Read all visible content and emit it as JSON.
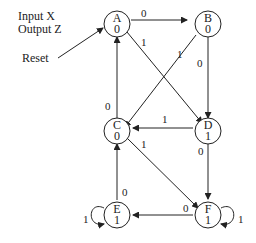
{
  "legend": {
    "input": "Input X",
    "output": "Output Z"
  },
  "reset_label": "Reset",
  "states": [
    {
      "name": "A",
      "output": "0"
    },
    {
      "name": "B",
      "output": "0"
    },
    {
      "name": "C",
      "output": "0"
    },
    {
      "name": "D",
      "output": "1"
    },
    {
      "name": "E",
      "output": "1"
    },
    {
      "name": "F",
      "output": "1"
    }
  ],
  "transitions": [
    {
      "from": "A",
      "to": "B",
      "input": "0"
    },
    {
      "from": "A",
      "to": "D",
      "input": "1"
    },
    {
      "from": "B",
      "to": "C",
      "input": "1"
    },
    {
      "from": "B",
      "to": "D",
      "input": "0"
    },
    {
      "from": "C",
      "to": "A",
      "input": "0"
    },
    {
      "from": "C",
      "to": "F",
      "input": "1"
    },
    {
      "from": "D",
      "to": "C",
      "input": "1"
    },
    {
      "from": "D",
      "to": "F",
      "input": "0"
    },
    {
      "from": "E",
      "to": "C",
      "input": "0"
    },
    {
      "from": "E",
      "to": "E",
      "input": "1"
    },
    {
      "from": "F",
      "to": "E",
      "input": "0"
    },
    {
      "from": "F",
      "to": "F",
      "input": "1"
    }
  ]
}
